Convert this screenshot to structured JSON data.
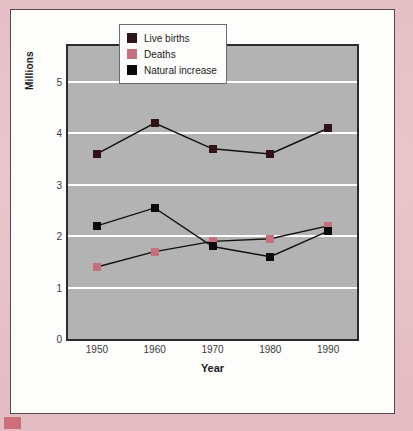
{
  "chart_data": {
    "type": "line",
    "title": "",
    "xlabel": "Year",
    "ylabel": "Millions",
    "categories": [
      "1950",
      "1960",
      "1970",
      "1980",
      "1990"
    ],
    "x": [
      1950,
      1960,
      1970,
      1980,
      1990
    ],
    "ylim": [
      0,
      5.7
    ],
    "yticks": [
      0,
      1,
      2,
      3,
      4,
      5
    ],
    "ytick_labels": [
      "0",
      "1",
      "2",
      "3",
      "4",
      "5"
    ],
    "grid": "horizontal",
    "gridline_values": [
      1,
      2,
      3,
      4,
      5
    ],
    "legend_position": "top-center",
    "series": [
      {
        "name": "Live births",
        "color": "#2e1416",
        "values": [
          3.6,
          4.2,
          3.7,
          3.6,
          4.1
        ]
      },
      {
        "name": "Deaths",
        "color": "#c4707f",
        "values": [
          1.4,
          1.7,
          1.9,
          1.95,
          2.2
        ]
      },
      {
        "name": "Natural increase",
        "color": "#0a0a0a",
        "values": [
          2.2,
          2.55,
          1.8,
          1.6,
          2.1
        ]
      }
    ]
  },
  "colors": {
    "page_background": "#e6bfc6",
    "card_background": "#fdfdfb",
    "plot_background": "#b3b3b3",
    "gridline": "#ffffff",
    "axis": "#2b2b2b",
    "corner_swatch": "#c9606e"
  }
}
